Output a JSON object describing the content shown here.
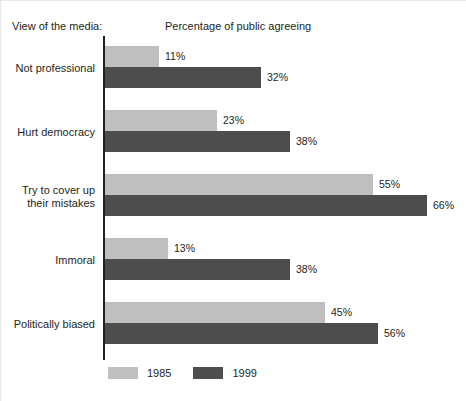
{
  "header": {
    "left_title": "View of the media:",
    "center_title": "Percentage of public agreeing"
  },
  "legend": {
    "items": [
      {
        "label": "1985",
        "color": "#bfbfbf"
      },
      {
        "label": "1999",
        "color": "#4d4d4d"
      }
    ]
  },
  "chart_data": {
    "type": "bar",
    "orientation": "horizontal",
    "title": "Percentage of public agreeing",
    "xlabel": "Percentage of public agreeing",
    "ylabel": "View of the media:",
    "xlim": [
      0,
      70
    ],
    "grid": false,
    "legend_position": "bottom-left",
    "categories": [
      "Not professional",
      "Hurt democracy",
      "Try to cover up\ntheir mistakes",
      "Immoral",
      "Politically biased"
    ],
    "series": [
      {
        "name": "1985",
        "color": "#bfbfbf",
        "values": [
          11,
          23,
          55,
          13,
          45
        ],
        "labels": [
          "11%",
          "23%",
          "55%",
          "13%",
          "45%"
        ]
      },
      {
        "name": "1999",
        "color": "#4d4d4d",
        "values": [
          32,
          38,
          66,
          38,
          56
        ],
        "labels": [
          "32%",
          "38%",
          "66%",
          "38%",
          "56%"
        ]
      }
    ]
  },
  "scale": {
    "px_per_percent": 4.88
  }
}
